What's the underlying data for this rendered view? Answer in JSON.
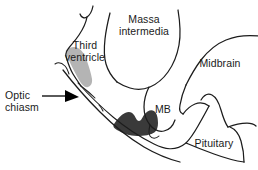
{
  "figure": {
    "background_color": "#ffffff",
    "outline_color": "#1c1c1c",
    "third_ventricle_fill": "#b4b4b4",
    "hypothalamus_fill": "#3a3a3a",
    "label_color": "#1a1a1a"
  },
  "labels": {
    "massa_intermedia": "Massa\nintermedia",
    "third_ventricle": "Third\nventricle",
    "midbrain": "Midbrain",
    "mammillary_body": "MB",
    "pituitary": "Pituitary",
    "optic_chiasm": "Optic\nchiasm"
  },
  "callouts": [
    {
      "name": "optic-chiasm-callout",
      "label": "Optic\nchiasm",
      "has_arrow": true,
      "arrow_direction": "right"
    }
  ],
  "regions": [
    {
      "name": "third-ventricle",
      "label": "Third ventricle",
      "fill": "#b4b4b4",
      "shaded": true
    },
    {
      "name": "hypothalamus-mass",
      "label": "",
      "fill": "#3a3a3a",
      "shaded": true
    },
    {
      "name": "massa-intermedia",
      "label": "Massa intermedia",
      "fill": "none",
      "shaded": false
    },
    {
      "name": "midbrain",
      "label": "Midbrain",
      "fill": "none",
      "shaded": false
    },
    {
      "name": "mammillary-body",
      "label": "MB",
      "fill": "none",
      "shaded": false
    },
    {
      "name": "pituitary",
      "label": "Pituitary",
      "fill": "none",
      "shaded": false
    },
    {
      "name": "optic-chiasm",
      "label": "Optic chiasm",
      "fill": "none",
      "shaded": false
    }
  ]
}
